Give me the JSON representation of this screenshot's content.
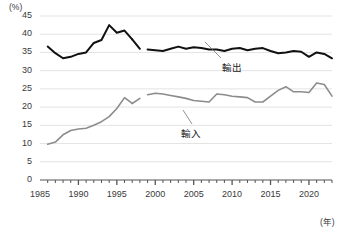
{
  "chart_data": {
    "type": "line",
    "title": "",
    "subtitle": "",
    "ylabel": "(%)",
    "xlabel": "(年)",
    "ylim": [
      0,
      45
    ],
    "xlim": [
      1985,
      2023
    ],
    "ytick_labels": [
      "0",
      "5",
      "10",
      "15",
      "20",
      "25",
      "30",
      "35",
      "40",
      "45"
    ],
    "ytick_values": [
      0,
      5,
      10,
      15,
      20,
      25,
      30,
      35,
      40,
      45
    ],
    "xtick_labels": [
      "1985",
      "1990",
      "1995",
      "2000",
      "2005",
      "2010",
      "2015",
      "2020"
    ],
    "xtick_values": [
      1985,
      1990,
      1995,
      2000,
      2005,
      2010,
      2015,
      2020
    ],
    "grid": true,
    "grid_axis": "y",
    "legend_position": "inline-annotation",
    "minor_ticks": "yearly",
    "series": [
      {
        "name": "輸出",
        "color": "#111111",
        "width": 2.0,
        "annotation": "輸出",
        "segments": [
          {
            "x": [
              1986,
              1987,
              1988,
              1989,
              1990,
              1991,
              1992,
              1993,
              1994,
              1995,
              1996,
              1997
            ],
            "values": [
              36.6,
              34.8,
              33.4,
              33.8,
              34.6,
              35.0,
              37.6,
              38.4,
              42.5,
              40.4,
              41.0,
              38.6
            ]
          },
          {
            "x": [
              1997,
              1998
            ],
            "values": [
              38.6,
              36.0
            ]
          },
          {
            "x": [
              1999,
              2000,
              2001,
              2002,
              2003,
              2004,
              2005,
              2006,
              2007,
              2008,
              2009,
              2010,
              2011,
              2012,
              2013,
              2014,
              2015,
              2016,
              2017,
              2018,
              2019,
              2020,
              2021,
              2022,
              2023
            ],
            "values": [
              35.8,
              35.6,
              35.4,
              36.0,
              36.6,
              36.0,
              36.4,
              36.2,
              35.8,
              35.8,
              35.4,
              36.0,
              36.2,
              35.6,
              36.0,
              36.2,
              35.4,
              34.8,
              35.0,
              35.4,
              35.2,
              33.8,
              35.0,
              34.6,
              33.4
            ]
          }
        ]
      },
      {
        "name": "輸入",
        "color": "#8c8c8c",
        "width": 1.6,
        "annotation": "輸入",
        "segments": [
          {
            "x": [
              1986,
              1987,
              1988,
              1989,
              1990,
              1991,
              1992,
              1993,
              1994,
              1995,
              1996,
              1997
            ],
            "values": [
              9.8,
              10.4,
              12.4,
              13.6,
              14.0,
              14.2,
              15.0,
              16.0,
              17.4,
              19.6,
              22.6,
              21.0
            ]
          },
          {
            "x": [
              1997,
              1998
            ],
            "values": [
              21.0,
              22.4
            ]
          },
          {
            "x": [
              1999,
              2000,
              2001,
              2002,
              2003,
              2004,
              2005,
              2006,
              2007,
              2008,
              2009,
              2010,
              2011,
              2012,
              2013,
              2014,
              2015,
              2016,
              2017,
              2018,
              2019,
              2020,
              2021,
              2022,
              2023
            ],
            "values": [
              23.4,
              23.8,
              23.6,
              23.2,
              22.8,
              22.4,
              21.8,
              21.6,
              21.4,
              23.6,
              23.4,
              23.0,
              22.8,
              22.6,
              21.4,
              21.4,
              23.0,
              24.6,
              25.6,
              24.2,
              24.2,
              24.0,
              26.6,
              26.2,
              23.0
            ]
          }
        ]
      }
    ]
  },
  "annotations": {
    "export_label": "輸出",
    "import_label": "輸入",
    "y_unit": "(%)",
    "x_unit": "(年)"
  },
  "colors": {
    "export_line": "#111111",
    "import_line": "#8c8c8c",
    "grid": "#e3e3e3",
    "axis": "#555555",
    "text": "#3a3a3a",
    "background": "#ffffff"
  }
}
